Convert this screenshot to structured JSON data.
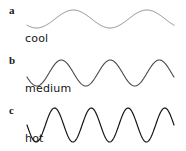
{
  "figure": {
    "background_color": "#ffffff",
    "width": 186,
    "height": 151
  },
  "panels": [
    {
      "letter": "a",
      "label": "cool",
      "stroke_color": "#8a8a8a",
      "stroke_width": 1.0,
      "cycles": 2,
      "amplitude": 9,
      "baseline": 19,
      "x_start": 27,
      "x_end": 174,
      "phase": 0.62
    },
    {
      "letter": "b",
      "label": "medium",
      "stroke_color": "#4a4a4a",
      "stroke_width": 1.1,
      "cycles": 3,
      "amplitude": 13,
      "baseline": 23,
      "x_start": 27,
      "x_end": 174,
      "phase": 0.55
    },
    {
      "letter": "c",
      "label": "hot",
      "stroke_color": "#141414",
      "stroke_width": 1.2,
      "cycles": 4,
      "amplitude": 17,
      "baseline": 25,
      "x_start": 27,
      "x_end": 174,
      "phase": 0.5
    }
  ],
  "chart_data": {
    "type": "line",
    "title": "",
    "xlabel": "",
    "ylabel": "",
    "grid": false,
    "legend": "none",
    "axis_visible": false,
    "series": [
      {
        "name": "cool",
        "panel": "a",
        "waveform": "sine",
        "cycles": 2,
        "relative_amplitude": 1.0,
        "relative_frequency": 1.0,
        "color": "#8a8a8a"
      },
      {
        "name": "medium",
        "panel": "b",
        "waveform": "sine",
        "cycles": 3,
        "relative_amplitude": 1.44,
        "relative_frequency": 1.5,
        "color": "#4a4a4a"
      },
      {
        "name": "hot",
        "panel": "c",
        "waveform": "sine",
        "cycles": 4,
        "relative_amplitude": 1.89,
        "relative_frequency": 2.0,
        "color": "#141414"
      }
    ],
    "categories": [
      "cool",
      "medium",
      "hot"
    ],
    "values": [
      2,
      3,
      4
    ]
  }
}
